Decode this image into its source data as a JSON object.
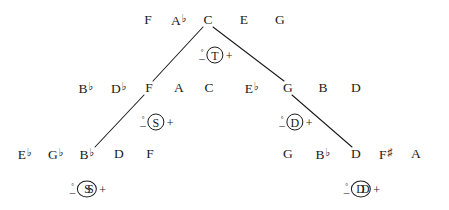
{
  "diagram": {
    "background_color": "#ffffff",
    "ink_color": "#1a1a1a",
    "levels": [
      {
        "name": "level-1-top",
        "notes": [
          "F",
          "A♭",
          "C",
          "E",
          "G"
        ]
      },
      {
        "name": "level-2",
        "notes": [
          "B♭",
          "D♭",
          "F",
          "A",
          "C",
          "E♭",
          "G",
          "B",
          "D"
        ]
      },
      {
        "name": "level-3",
        "notes": [
          "E♭",
          "G♭",
          "B♭",
          "D",
          "F",
          "G",
          "B♭",
          "D",
          "F♯",
          "A"
        ]
      }
    ],
    "notes": [
      {
        "id": "n-top-f",
        "label": "F",
        "accidental": "",
        "x": 148,
        "y": 20
      },
      {
        "id": "n-top-ab",
        "label": "A",
        "accidental": "♭",
        "x": 179,
        "y": 20
      },
      {
        "id": "n-top-c",
        "label": "C",
        "accidental": "",
        "x": 208,
        "y": 20
      },
      {
        "id": "n-top-e",
        "label": "E",
        "accidental": "",
        "x": 244,
        "y": 20
      },
      {
        "id": "n-top-g",
        "label": "G",
        "accidental": "",
        "x": 280,
        "y": 20
      },
      {
        "id": "n-m-bb",
        "label": "B",
        "accidental": "♭",
        "x": 86,
        "y": 88
      },
      {
        "id": "n-m-db",
        "label": "D",
        "accidental": "♭",
        "x": 119,
        "y": 88
      },
      {
        "id": "n-m-f",
        "label": "F",
        "accidental": "",
        "x": 149,
        "y": 88
      },
      {
        "id": "n-m-a",
        "label": "A",
        "accidental": "",
        "x": 179,
        "y": 88
      },
      {
        "id": "n-m-c",
        "label": "C",
        "accidental": "",
        "x": 209,
        "y": 88
      },
      {
        "id": "n-m-eb",
        "label": "E",
        "accidental": "♭",
        "x": 252,
        "y": 88
      },
      {
        "id": "n-m-g",
        "label": "G",
        "accidental": "",
        "x": 288,
        "y": 88
      },
      {
        "id": "n-m-b",
        "label": "B",
        "accidental": "",
        "x": 323,
        "y": 88
      },
      {
        "id": "n-m-d",
        "label": "D",
        "accidental": "",
        "x": 356,
        "y": 88
      },
      {
        "id": "n-b-eb",
        "label": "E",
        "accidental": "♭",
        "x": 25,
        "y": 154
      },
      {
        "id": "n-b-gb",
        "label": "G",
        "accidental": "♭",
        "x": 56,
        "y": 154
      },
      {
        "id": "n-b-bb",
        "label": "B",
        "accidental": "♭",
        "x": 87,
        "y": 154
      },
      {
        "id": "n-b-d",
        "label": "D",
        "accidental": "",
        "x": 119,
        "y": 154
      },
      {
        "id": "n-b-f",
        "label": "F",
        "accidental": "",
        "x": 150,
        "y": 154
      },
      {
        "id": "n-b-g",
        "label": "G",
        "accidental": "",
        "x": 288,
        "y": 154
      },
      {
        "id": "n-b-bb2",
        "label": "B",
        "accidental": "♭",
        "x": 323,
        "y": 154
      },
      {
        "id": "n-b-d2",
        "label": "D",
        "accidental": "",
        "x": 356,
        "y": 154
      },
      {
        "id": "n-b-fs",
        "label": "F",
        "accidental": "♯",
        "x": 386,
        "y": 154
      },
      {
        "id": "n-b-a",
        "label": "A",
        "accidental": "",
        "x": 416,
        "y": 154
      }
    ],
    "functions": [
      {
        "id": "fn-tonic",
        "degree": "°",
        "minus": "–",
        "symbol": "T",
        "double": false,
        "plus": "+",
        "x": 216,
        "y": 55
      },
      {
        "id": "fn-subdominant",
        "degree": "°",
        "minus": "–",
        "symbol": "S",
        "double": false,
        "plus": "+",
        "x": 157,
        "y": 122
      },
      {
        "id": "fn-dominant",
        "degree": "°",
        "minus": "–",
        "symbol": "D",
        "double": false,
        "plus": "+",
        "x": 296,
        "y": 122
      },
      {
        "id": "fn-sub-subdom",
        "degree": "°",
        "minus": "–",
        "symbol": "SS",
        "double": true,
        "plus": "+",
        "x": 88,
        "y": 189
      },
      {
        "id": "fn-dom-dom",
        "degree": "°",
        "minus": "–",
        "symbol": "DD",
        "double": true,
        "plus": "+",
        "x": 362,
        "y": 189
      }
    ],
    "edges": [
      {
        "id": "edge-tonic-to-subdominant",
        "x1": 203,
        "y1": 27,
        "x2": 153,
        "y2": 81
      },
      {
        "id": "edge-tonic-to-dominant",
        "x1": 213,
        "y1": 27,
        "x2": 284,
        "y2": 81
      },
      {
        "id": "edge-sub-to-subsub",
        "x1": 144,
        "y1": 95,
        "x2": 95,
        "y2": 147
      },
      {
        "id": "edge-dom-to-domdom",
        "x1": 292,
        "y1": 95,
        "x2": 352,
        "y2": 147
      }
    ]
  }
}
